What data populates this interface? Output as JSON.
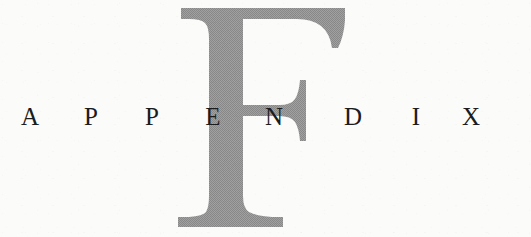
{
  "page": {
    "kind": "book-appendix-divider-page",
    "background_color": "#fbfbfa"
  },
  "dropcap": {
    "letter": "F",
    "color": "#9a9a9a",
    "texture": "halftone-dither",
    "style": "serif-didone"
  },
  "heading": {
    "text": "APPENDIX",
    "color": "#1c1c1c",
    "letters": [
      {
        "char": "A",
        "x": 30
      },
      {
        "char": "P",
        "x": 91
      },
      {
        "char": "P",
        "x": 152
      },
      {
        "char": "E",
        "x": 213
      },
      {
        "char": "N",
        "x": 274
      },
      {
        "char": "D",
        "x": 353
      },
      {
        "char": "I",
        "x": 416
      },
      {
        "char": "X",
        "x": 471
      }
    ]
  }
}
